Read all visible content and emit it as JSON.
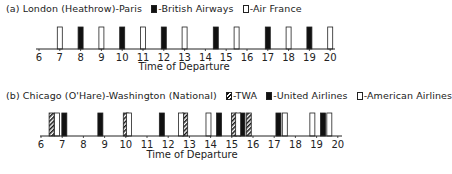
{
  "chart_data": [
    {
      "type": "bar",
      "title": "(a) London (Heathrow)-Paris",
      "xlabel": "Time of Departure",
      "ylabel": "",
      "xlim": [
        6,
        20
      ],
      "x_ticks": [
        6,
        7,
        8,
        9,
        10,
        11,
        12,
        13,
        14,
        15,
        16,
        17,
        18,
        19,
        20
      ],
      "legend": [
        {
          "name": "British Airways",
          "style": "black"
        },
        {
          "name": "Air France",
          "style": "white"
        }
      ],
      "series": [
        {
          "name": "British Airways",
          "style": "black",
          "x": [
            8,
            10,
            12,
            14.5,
            17,
            19
          ]
        },
        {
          "name": "Air France",
          "style": "white",
          "x": [
            7,
            9,
            11,
            13,
            15.5,
            18,
            20
          ]
        }
      ]
    },
    {
      "type": "bar",
      "title": "(b) Chicago (O'Hare)-Washington (National)",
      "xlabel": "Time of Departure",
      "ylabel": "",
      "xlim": [
        6,
        20
      ],
      "x_ticks": [
        6,
        7,
        8,
        9,
        10,
        11,
        12,
        13,
        14,
        15,
        16,
        17,
        18,
        19,
        20
      ],
      "legend": [
        {
          "name": "TWA",
          "style": "hatch"
        },
        {
          "name": "United Airlines",
          "style": "black"
        },
        {
          "name": "American Airlines",
          "style": "white"
        }
      ],
      "series": [
        {
          "name": "TWA",
          "style": "hatch",
          "x": [
            6.5,
            10.0,
            12.8,
            15.1,
            15.8
          ]
        },
        {
          "name": "United Airlines",
          "style": "black",
          "x": [
            7.1,
            8.8,
            11.7,
            14.4,
            15.5,
            17.2,
            19.3
          ]
        },
        {
          "name": "American Airlines",
          "style": "white",
          "x": [
            6.75,
            10.15,
            12.6,
            13.9,
            15.3,
            17.5,
            18.8,
            19.6
          ]
        }
      ]
    }
  ],
  "charts": {
    "a": {
      "title": "(a) London (Heathrow)-Paris",
      "legend": [
        "-British Airways",
        "-Air France"
      ],
      "xlabel": "Time of Departure"
    },
    "b": {
      "title": "(b) Chicago (O'Hare)-Washington (National)",
      "legend": [
        "-TWA",
        "-United Airlines",
        "-American Airlines"
      ],
      "xlabel": "Time of Departure"
    }
  }
}
